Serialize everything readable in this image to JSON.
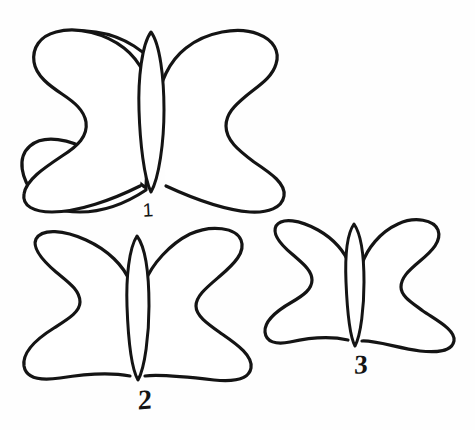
{
  "drawing": {
    "title": "Three hand-drawn butterfly outlines",
    "style": "black ink line drawing on white background",
    "background_color": "#fefefe",
    "ink_color": "#141414",
    "figures": [
      {
        "id": "butterfly-1",
        "label": "1",
        "size_rank": "large",
        "label_x": 148,
        "label_y": 210,
        "bounds": {
          "x": 22,
          "y": 26,
          "width": 263,
          "height": 186
        }
      },
      {
        "id": "butterfly-2",
        "label": "2",
        "size_rank": "medium",
        "label_x": 145,
        "label_y": 400,
        "bounds": {
          "x": 22,
          "y": 231,
          "width": 231,
          "height": 167
        }
      },
      {
        "id": "butterfly-3",
        "label": "3",
        "size_rank": "small",
        "label_x": 361,
        "label_y": 365,
        "bounds": {
          "x": 265,
          "y": 222,
          "width": 190,
          "height": 133
        }
      }
    ],
    "parts": [
      "left-wing",
      "right-wing",
      "body"
    ]
  }
}
